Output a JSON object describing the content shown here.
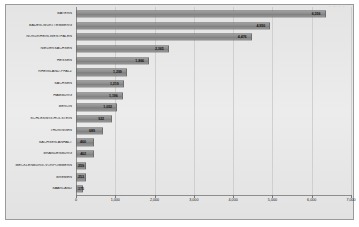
{
  "chart_data": {
    "type": "bar",
    "orientation": "horizontal",
    "title": "",
    "xlabel": "",
    "ylabel": "",
    "xlim": [
      0,
      7000
    ],
    "grid": true,
    "legend": "none",
    "xticks": [
      "0",
      "1,000",
      "2,000",
      "3,000",
      "4,000",
      "5,000",
      "6,000",
      "7,000"
    ],
    "xtick_values": [
      0,
      1000,
      2000,
      3000,
      4000,
      5000,
      6000,
      7000
    ],
    "categories": [
      "BAYERN",
      "BADEN-WÜRTTEMBERG",
      "NORDRHEIN-WESTFALEN",
      "NIEDERSACHSEN",
      "HESSEN",
      "RHEINLAND-PFALZ",
      "SACHSEN",
      "HAMBURG",
      "BERLIN",
      "SCHLESWIG-HOLSTEIN",
      "THÜRINGEN",
      "SACHSEN-ANHALT",
      "BRANDENBURG",
      "MECKLENBURG-VORPOMMERN",
      "BREMEN",
      "SAARLAND"
    ],
    "values": [
      6356,
      4950,
      4476,
      2365,
      1866,
      1299,
      1219,
      1196,
      1052,
      922,
      689,
      460,
      462,
      259,
      253,
      175
    ],
    "value_labels": [
      "6,356",
      "4,950",
      "4,476",
      "2,365",
      "1,866",
      "1,299",
      "1,219",
      "1,196",
      "1,052",
      "922",
      "689",
      "460",
      "462",
      "259",
      "253",
      "175"
    ],
    "bar_color": "#8c8c8c",
    "background_color": "#e8e8e8",
    "grid_color": "#cfcfcf",
    "axis_color": "#8d8d8d"
  },
  "top_marks": "• ••  • •"
}
